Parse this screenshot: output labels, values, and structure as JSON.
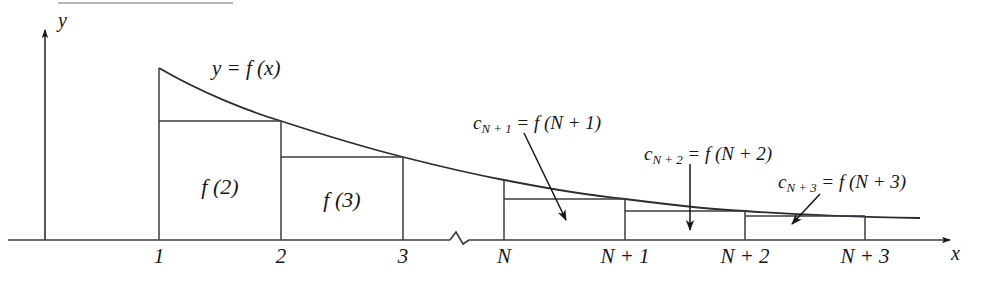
{
  "figure": {
    "background_color": "#ffffff",
    "ink_color": "#16161a",
    "width": 983,
    "height": 287
  },
  "axes": {
    "y_label": "y",
    "x_label": "x",
    "x_axis_y": 240,
    "y_axis_x": 45,
    "has_break": true,
    "break_label": "axis-break-squiggle"
  },
  "ticks": [
    {
      "label": "1",
      "x": 159,
      "kind": "integer"
    },
    {
      "label": "2",
      "x": 281,
      "kind": "integer"
    },
    {
      "label": "3",
      "x": 403,
      "kind": "integer"
    },
    {
      "label": "N",
      "x": 504,
      "kind": "symbolic"
    },
    {
      "label": "N + 1",
      "x": 625,
      "kind": "symbolic"
    },
    {
      "label": "N + 2",
      "x": 745,
      "kind": "symbolic"
    },
    {
      "label": "N + 3",
      "x": 865,
      "kind": "symbolic"
    }
  ],
  "curve": {
    "label": "y = f (x)",
    "label_x": 212,
    "label_y": 58,
    "description": "decreasing convex curve y = f(x)",
    "points": [
      [
        159,
        68
      ],
      [
        200,
        89
      ],
      [
        240,
        106
      ],
      [
        281,
        121
      ],
      [
        320,
        134
      ],
      [
        360,
        146
      ],
      [
        403,
        157
      ],
      [
        450,
        168
      ],
      [
        504,
        180
      ],
      [
        560,
        190
      ],
      [
        625,
        199
      ],
      [
        690,
        206
      ],
      [
        745,
        211
      ],
      [
        800,
        214
      ],
      [
        865,
        216
      ],
      [
        920,
        218
      ]
    ]
  },
  "rectangles": [
    {
      "name": "f(2)",
      "x0": 159,
      "x1": 281,
      "top": 121,
      "label": "f (2)",
      "label_x": 220,
      "label_y": 176
    },
    {
      "name": "f(3)",
      "x0": 281,
      "x1": 403,
      "top": 157,
      "label": "f (3)",
      "label_x": 342,
      "label_y": 189
    },
    {
      "name": "c_{N+1}",
      "x0": 504,
      "x1": 625,
      "top": 199,
      "label": "",
      "label_x": 0,
      "label_y": 0
    },
    {
      "name": "c_{N+2}",
      "x0": 625,
      "x1": 745,
      "top": 211,
      "label": "",
      "label_x": 0,
      "label_y": 0
    },
    {
      "name": "c_{N+3}",
      "x0": 745,
      "x1": 865,
      "top": 216,
      "label": "",
      "label_x": 0,
      "label_y": 0
    }
  ],
  "verticals": [
    {
      "x": 159,
      "y_top": 68
    },
    {
      "x": 281,
      "y_top": 121
    },
    {
      "x": 403,
      "y_top": 157
    },
    {
      "x": 504,
      "y_top": 180
    },
    {
      "x": 625,
      "y_top": 199
    },
    {
      "x": 745,
      "y_top": 211
    },
    {
      "x": 865,
      "y_top": 216
    }
  ],
  "annotations": [
    {
      "id": "c-n-plus-1",
      "base": "c",
      "sub": "N + 1",
      "equals": " = ",
      "rhs": "f (N + 1)",
      "text": "c_{N+1} = f (N + 1)",
      "label_x": 473,
      "label_y": 113,
      "arrow": {
        "x1": 524,
        "y1": 133,
        "x2": 568,
        "y2": 222
      }
    },
    {
      "id": "c-n-plus-2",
      "base": "c",
      "sub": "N + 2",
      "equals": " = ",
      "rhs": "f (N + 2)",
      "text": "c_{N+2} = f (N + 2)",
      "label_x": 644,
      "label_y": 144,
      "arrow": {
        "x1": 690,
        "y1": 164,
        "x2": 690,
        "y2": 232
      }
    },
    {
      "id": "c-n-plus-3",
      "base": "c",
      "sub": "N + 3",
      "equals": " = ",
      "rhs": "f (N + 3)",
      "text": "c_{N+3} = f (N + 3)",
      "label_x": 778,
      "label_y": 172,
      "arrow": {
        "x1": 818,
        "y1": 192,
        "x2": 790,
        "y2": 225
      }
    }
  ]
}
